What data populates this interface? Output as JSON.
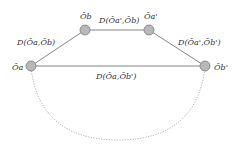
{
  "diagram": {
    "nodes": [
      {
        "id": "Oa",
        "label": "Ôₐ",
        "x": 31,
        "y": 66
      },
      {
        "id": "Ob",
        "label": "Ô_b",
        "x": 85,
        "y": 30
      },
      {
        "id": "Oa2",
        "label": "Ôₐ'",
        "x": 149,
        "y": 30
      },
      {
        "id": "Ob2",
        "label": "Ô_b'",
        "x": 205,
        "y": 66
      }
    ],
    "node_labels": {
      "Oa": "Ôa",
      "Ob": "Ôb",
      "Oa2": "Ôa'",
      "Ob2": "Ôb'"
    },
    "edge_labels": {
      "Oa_Ob": "D(Ôa,Ôb)",
      "Oa2_Ob": "D(Ôa',Ôb)",
      "Oa2_Ob2": "D(Ôa',Ôb')",
      "Oa_Ob2": "D(Ôa,Ôb')"
    },
    "colors": {
      "node_fill": "#b8b8b8",
      "node_stroke": "#7a7a7a",
      "edge": "#555555",
      "arc": "#888888"
    }
  }
}
